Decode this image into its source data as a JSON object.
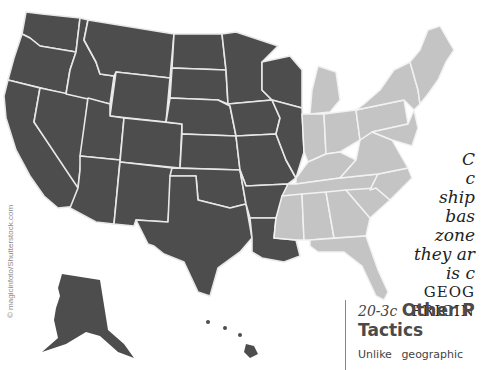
{
  "figure": {
    "type": "us_zone_map",
    "zones": [
      {
        "name": "western-zone",
        "color": "#4d4d4d"
      },
      {
        "name": "eastern-zone",
        "color": "#c4c4c4"
      }
    ],
    "border_color": "#e8e8e8",
    "credit": "© magicinfoto/Shutterstock.com"
  },
  "caption": {
    "lines": [
      "C",
      "c",
      "ship",
      "bas",
      "zone",
      "they ar",
      "is c"
    ],
    "caps_lines": [
      "GEOG",
      "PRICIN"
    ]
  },
  "section": {
    "number": "20-3c",
    "title_line1": "Other P",
    "title_line2": "Tactics",
    "body_start": "Unlike geographic"
  }
}
